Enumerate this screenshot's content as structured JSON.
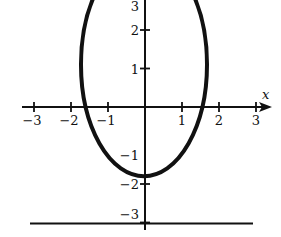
{
  "chart_data": {
    "type": "line",
    "title": "",
    "xlabel": "x",
    "ylabel": "",
    "xlim": [
      -3.2,
      3.2
    ],
    "ylim": [
      -3.3,
      3.9
    ],
    "grid": false,
    "legend": null,
    "x_ticks": [
      -3,
      -2,
      -1,
      1,
      2,
      3
    ],
    "x_tick_labels": [
      "−3",
      "−2",
      "−1",
      "1",
      "2",
      "3"
    ],
    "y_ticks": [
      3,
      2,
      1,
      -1,
      -2,
      -3
    ],
    "y_tick_labels": [
      "3",
      "2",
      "1",
      "−1",
      "−2",
      "−3"
    ],
    "series": [
      {
        "name": "ellipse",
        "shape": "ellipse",
        "center": [
          0,
          1
        ],
        "semi_axis_x": 1.73,
        "semi_axis_y": 2.9,
        "stroke_width": "thick",
        "color": "#111111",
        "note": "top of curve clipped by image edge"
      },
      {
        "name": "horizontal line",
        "shape": "line",
        "y": -3,
        "x_range": [
          -3.1,
          3.0
        ],
        "color": "#111111"
      }
    ]
  },
  "colors": {
    "ink": "#111111",
    "background": "#ffffff"
  }
}
